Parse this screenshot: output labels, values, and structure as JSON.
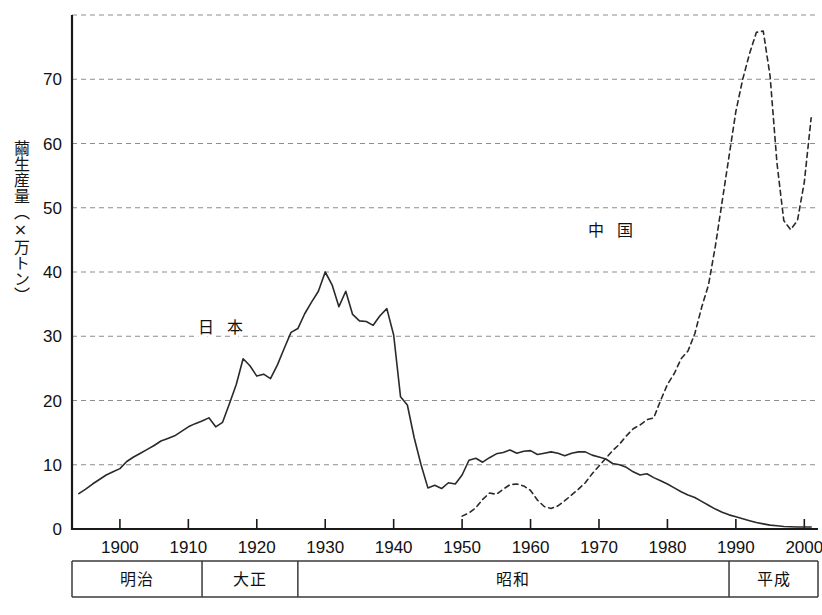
{
  "chart_data": {
    "type": "line",
    "title": "",
    "xlabel": "",
    "ylabel": "繭生産量（×万トン）",
    "xlim": [
      1893,
      2002
    ],
    "ylim": [
      0,
      80
    ],
    "grid": true,
    "grid_axis": "y",
    "legend_position": "inline-annotation",
    "x_ticks": [
      1900,
      1910,
      1920,
      1930,
      1940,
      1950,
      1960,
      1970,
      1980,
      1990,
      2000
    ],
    "x_tick_labels": [
      "1900",
      "1910",
      "1920",
      "1930",
      "1940",
      "1950",
      "1960",
      "1970",
      "1980",
      "1990",
      "2000"
    ],
    "y_ticks": [
      0,
      10,
      20,
      30,
      40,
      50,
      60,
      70
    ],
    "y_tick_labels": [
      "0",
      "10",
      "20",
      "30",
      "40",
      "50",
      "60",
      "70"
    ],
    "y_gridlines": [
      10,
      20,
      30,
      40,
      50,
      60,
      70,
      80
    ],
    "series": [
      {
        "name": "日 本",
        "label": "日 本",
        "style": "solid",
        "label_x": 1915,
        "label_y": 31.5,
        "x": [
          1894,
          1895,
          1896,
          1897,
          1898,
          1899,
          1900,
          1901,
          1902,
          1903,
          1904,
          1905,
          1906,
          1907,
          1908,
          1909,
          1910,
          1911,
          1912,
          1913,
          1914,
          1915,
          1916,
          1917,
          1918,
          1919,
          1920,
          1921,
          1922,
          1923,
          1924,
          1925,
          1926,
          1927,
          1928,
          1929,
          1930,
          1931,
          1932,
          1933,
          1934,
          1935,
          1936,
          1937,
          1938,
          1939,
          1940,
          1941,
          1942,
          1943,
          1944,
          1945,
          1946,
          1947,
          1948,
          1949,
          1950,
          1951,
          1952,
          1953,
          1954,
          1955,
          1956,
          1957,
          1958,
          1959,
          1960,
          1961,
          1962,
          1963,
          1964,
          1965,
          1966,
          1967,
          1968,
          1969,
          1970,
          1971,
          1972,
          1973,
          1974,
          1975,
          1976,
          1977,
          1978,
          1979,
          1980,
          1981,
          1982,
          1983,
          1984,
          1985,
          1986,
          1987,
          1988,
          1989,
          1990,
          1991,
          1992,
          1993,
          1994,
          1995,
          1996,
          1997,
          1998,
          1999,
          2000,
          2001
        ],
        "y": [
          5.5,
          6.2,
          7.0,
          7.7,
          8.4,
          8.9,
          9.4,
          10.5,
          11.2,
          11.8,
          12.4,
          13.0,
          13.7,
          14.1,
          14.5,
          15.2,
          15.9,
          16.4,
          16.8,
          17.3,
          15.9,
          16.6,
          19.5,
          22.5,
          26.5,
          25.4,
          23.8,
          24.1,
          23.4,
          25.5,
          28.1,
          30.6,
          31.2,
          33.5,
          35.3,
          37.0,
          40.0,
          38.0,
          34.6,
          37.0,
          33.4,
          32.4,
          32.3,
          31.7,
          33.2,
          34.3,
          30.2,
          20.6,
          19.3,
          14.2,
          10.0,
          6.4,
          6.8,
          6.3,
          7.2,
          7.0,
          8.4,
          10.7,
          11.0,
          10.4,
          11.1,
          11.7,
          11.9,
          12.3,
          11.8,
          12.1,
          12.2,
          11.6,
          11.8,
          12.0,
          11.8,
          11.4,
          11.8,
          12.0,
          12.0,
          11.5,
          11.2,
          10.9,
          10.2,
          10.0,
          9.6,
          8.9,
          8.4,
          8.6,
          8.0,
          7.5,
          7.0,
          6.4,
          5.8,
          5.3,
          4.9,
          4.3,
          3.7,
          3.1,
          2.6,
          2.2,
          1.9,
          1.6,
          1.3,
          1.0,
          0.8,
          0.6,
          0.5,
          0.4,
          0.35,
          0.3,
          0.3,
          0.3
        ]
      },
      {
        "name": "中 国",
        "label": "中 国",
        "style": "dashed",
        "label_x": 1972,
        "label_y": 46.5,
        "x": [
          1950,
          1951,
          1952,
          1953,
          1954,
          1955,
          1956,
          1957,
          1958,
          1959,
          1960,
          1961,
          1962,
          1963,
          1964,
          1965,
          1966,
          1967,
          1968,
          1969,
          1970,
          1971,
          1972,
          1973,
          1974,
          1975,
          1976,
          1977,
          1978,
          1979,
          1980,
          1981,
          1982,
          1983,
          1984,
          1985,
          1986,
          1987,
          1988,
          1989,
          1990,
          1991,
          1992,
          1993,
          1994,
          1995,
          1996,
          1997,
          1998,
          1999,
          2000,
          2001
        ],
        "y": [
          2.0,
          2.5,
          3.3,
          4.6,
          5.6,
          5.4,
          6.2,
          6.9,
          7.0,
          6.7,
          6.0,
          4.5,
          3.5,
          3.2,
          3.6,
          4.4,
          5.3,
          6.2,
          7.2,
          8.6,
          9.8,
          11.0,
          12.2,
          13.2,
          14.5,
          15.6,
          16.2,
          17.0,
          17.3,
          20.0,
          22.5,
          24.2,
          26.5,
          27.7,
          30.4,
          34.5,
          38.0,
          44.0,
          51.0,
          58.0,
          65.0,
          70.0,
          74.0,
          77.3,
          77.5,
          70.5,
          57.0,
          48.0,
          46.6,
          48.0,
          54.0,
          64.0
        ]
      }
    ],
    "annotations": [
      {
        "text": "日 本",
        "x": 1915,
        "y": 31.5
      },
      {
        "text": "中 国",
        "x": 1972,
        "y": 46.5
      }
    ]
  },
  "era_bar": {
    "eras": [
      {
        "label": "明治",
        "start": 1893,
        "end": 1912
      },
      {
        "label": "大正",
        "start": 1912,
        "end": 1926
      },
      {
        "label": "昭和",
        "start": 1926,
        "end": 1989
      },
      {
        "label": "平成",
        "start": 1989,
        "end": 2002
      }
    ]
  }
}
